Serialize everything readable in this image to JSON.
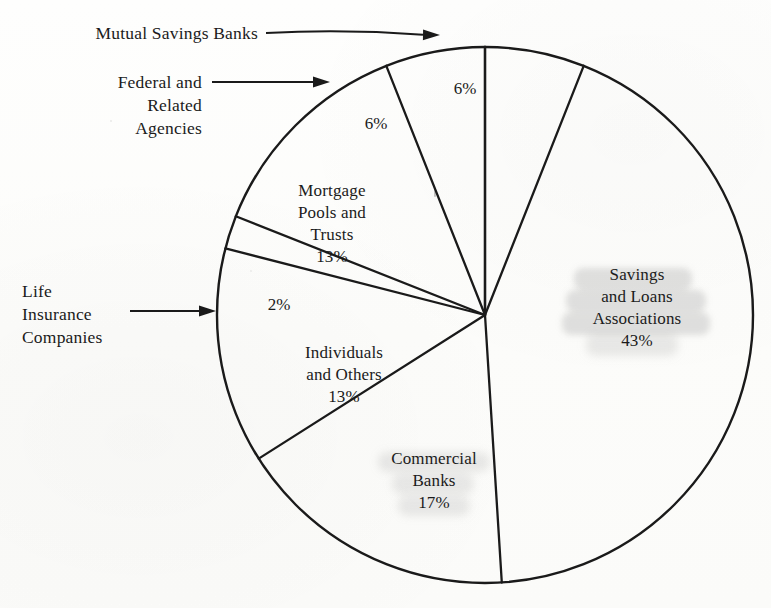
{
  "chart_data": {
    "type": "pie",
    "title": "",
    "total_label": "100%",
    "center": {
      "x": 485,
      "y": 315
    },
    "radius": 268,
    "legend_position": "callouts",
    "units": "percent",
    "categories": [
      "Mutual Savings Banks",
      "Savings and Loans Associations",
      "Commercial Banks",
      "Individuals and Others",
      "Life Insurance Companies",
      "Mortgage Pools and Trusts",
      "Federal and Related Agencies"
    ],
    "values": [
      6,
      43,
      17,
      13,
      2,
      13,
      6
    ],
    "slices": [
      {
        "name": "Mutual Savings Banks",
        "value": 6,
        "percent_label": "6%",
        "label_mode": "callout",
        "start_angle_deg": 0,
        "end_angle_deg": 21.6,
        "pct_x": 465,
        "pct_y": 87,
        "highlighted": false
      },
      {
        "name": "Savings and Loans Associations",
        "value": 43,
        "percent_label": "43%",
        "label_mode": "inside",
        "label_lines": [
          "Savings",
          "and Loans",
          "Associations"
        ],
        "start_angle_deg": 21.6,
        "end_angle_deg": 176.4,
        "label_x": 638,
        "label_y": 272,
        "highlighted": true
      },
      {
        "name": "Commercial Banks",
        "value": 17,
        "percent_label": "17%",
        "label_mode": "inside",
        "label_lines": [
          "Commercial",
          "Banks"
        ],
        "start_angle_deg": 176.4,
        "end_angle_deg": 237.6,
        "label_x": 432,
        "label_y": 451,
        "highlighted": true
      },
      {
        "name": "Individuals and Others",
        "value": 13,
        "percent_label": "13%",
        "label_mode": "inside",
        "label_lines": [
          "Individuals",
          "and Others"
        ],
        "start_angle_deg": 237.6,
        "end_angle_deg": 284.4,
        "label_x": 342,
        "label_y": 345,
        "highlighted": false
      },
      {
        "name": "Life Insurance Companies",
        "value": 2,
        "percent_label": "2%",
        "label_mode": "callout",
        "start_angle_deg": 284.4,
        "end_angle_deg": 291.6,
        "pct_x": 279,
        "pct_y": 303,
        "highlighted": false
      },
      {
        "name": "Mortgage Pools and Trusts",
        "value": 13,
        "percent_label": "13%",
        "label_mode": "inside",
        "label_lines": [
          "Mortgage",
          "Pools and",
          "Trusts"
        ],
        "start_angle_deg": 291.6,
        "end_angle_deg": 338.4,
        "label_x": 330,
        "label_y": 183,
        "highlighted": false
      },
      {
        "name": "Federal and Related Agencies",
        "value": 6,
        "percent_label": "6%",
        "label_mode": "callout",
        "start_angle_deg": 338.4,
        "end_angle_deg": 360,
        "pct_x": 376,
        "pct_y": 122,
        "highlighted": false
      }
    ]
  },
  "callouts": [
    {
      "id": "mutual-savings-banks",
      "lines": [
        "Mutual Savings Banks"
      ],
      "align": "right",
      "text_x": 58,
      "text_y": 22,
      "text_w": 200,
      "arrow": {
        "x1": 266,
        "y1": 33,
        "x2": 440,
        "y2": 35,
        "curve": true
      }
    },
    {
      "id": "federal-and-related-agencies",
      "lines": [
        "Federal and",
        "Related",
        "Agencies"
      ],
      "align": "right",
      "text_x": 80,
      "text_y": 71,
      "text_w": 122,
      "arrow": {
        "x1": 212,
        "y1": 82,
        "x2": 330,
        "y2": 82,
        "curve": false
      }
    },
    {
      "id": "life-insurance-companies",
      "lines": [
        "Life",
        "Insurance",
        "Companies"
      ],
      "align": "left",
      "text_x": 22,
      "text_y": 280,
      "text_w": 110,
      "arrow": {
        "x1": 130,
        "y1": 311,
        "x2": 216,
        "y2": 311,
        "curve": false
      }
    }
  ],
  "style": {
    "stroke_color": "#1a1a1a",
    "background": "#fdfdfc",
    "text_color": "#1b1b1b",
    "highlight_color": "#6e6e6e"
  }
}
